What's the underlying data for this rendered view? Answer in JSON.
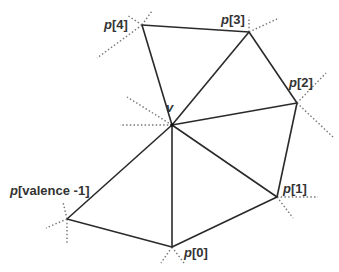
{
  "diagram": {
    "type": "vertex-one-ring",
    "center": {
      "id": "v",
      "label": "v",
      "x": 172,
      "y": 125,
      "label_x": 166,
      "label_y": 112
    },
    "neighbors": [
      {
        "id": "p0",
        "prefix": "p",
        "index": "[0]",
        "x": 172,
        "y": 247,
        "label_x": 184,
        "label_y": 257
      },
      {
        "id": "p1",
        "prefix": "p",
        "index": "[1]",
        "x": 277,
        "y": 197,
        "label_x": 283,
        "label_y": 193
      },
      {
        "id": "p2",
        "prefix": "p",
        "index": "[2]",
        "x": 297,
        "y": 103,
        "label_x": 289,
        "label_y": 87
      },
      {
        "id": "p3",
        "prefix": "p",
        "index": "[3]",
        "x": 249,
        "y": 32,
        "label_x": 221,
        "label_y": 24
      },
      {
        "id": "p4",
        "prefix": "p",
        "index": "[4]",
        "x": 142,
        "y": 25,
        "label_x": 104,
        "label_y": 29
      },
      {
        "id": "pv",
        "prefix": "p",
        "index": "[valence -1]",
        "x": 67,
        "y": 219,
        "label_x": 10,
        "label_y": 195
      }
    ],
    "edges": [
      [
        "v",
        "p0"
      ],
      [
        "v",
        "p1"
      ],
      [
        "v",
        "p2"
      ],
      [
        "v",
        "p3"
      ],
      [
        "v",
        "p4"
      ],
      [
        "v",
        "pv"
      ],
      [
        "p0",
        "p1"
      ],
      [
        "p1",
        "p2"
      ],
      [
        "p2",
        "p3"
      ],
      [
        "p3",
        "p4"
      ],
      [
        "pv",
        "p0"
      ]
    ],
    "dotted_stubs": [
      {
        "from": "v",
        "to": [
          120,
          125
        ]
      },
      {
        "from": "v",
        "to": [
          127,
          97
        ]
      },
      {
        "from": "p4",
        "to": [
          127,
          15
        ]
      },
      {
        "from": "p4",
        "to": [
          152,
          11
        ]
      },
      {
        "from": "p4",
        "to": [
          97,
          58
        ]
      },
      {
        "from": "p3",
        "to": [
          249,
          17
        ]
      },
      {
        "from": "p3",
        "to": [
          277,
          19
        ]
      },
      {
        "from": "p2",
        "to": [
          326,
          73
        ]
      },
      {
        "from": "p2",
        "to": [
          333,
          137
        ]
      },
      {
        "from": "p1",
        "to": [
          318,
          197
        ]
      },
      {
        "from": "p1",
        "to": [
          293,
          218
        ]
      },
      {
        "from": "p0",
        "to": [
          161,
          263
        ]
      },
      {
        "from": "p0",
        "to": [
          184,
          263
        ]
      },
      {
        "from": "pv",
        "to": [
          63,
          202
        ]
      },
      {
        "from": "pv",
        "to": [
          67,
          245
        ]
      },
      {
        "from": "pv",
        "to": [
          46,
          228
        ]
      }
    ]
  }
}
